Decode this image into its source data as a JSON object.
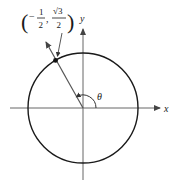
{
  "diagram": {
    "type": "unit-circle",
    "point_label": {
      "x_num": "1",
      "x_den": "2",
      "x_sign": "−",
      "y_num": "√3",
      "y_den": "2",
      "open": "(",
      "close": ")",
      "sep": ","
    },
    "angle_label": "θ",
    "x_axis_label": "x",
    "y_axis_label": "y",
    "angle_degrees": 120,
    "colors": {
      "stroke": "#1a1a1a",
      "axis": "#555555"
    }
  }
}
